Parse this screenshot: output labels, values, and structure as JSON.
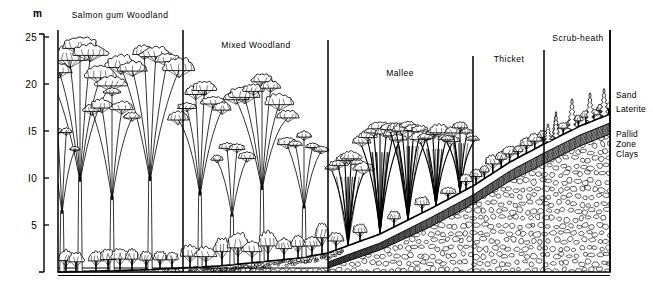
{
  "figure": {
    "axis_unit_label": "m",
    "y_ticks": [
      "25",
      "20",
      "I5",
      "I0",
      "5"
    ],
    "y_tick_values": [
      25,
      20,
      15,
      10,
      5
    ]
  },
  "vegetation_zones": [
    {
      "name": "Salmon gum Woodland",
      "label_x": 120,
      "label_y": 18
    },
    {
      "name": "Mixed Woodland",
      "label_x": 256,
      "label_y": 48
    },
    {
      "name": "Mallee",
      "label_x": 400,
      "label_y": 76
    },
    {
      "name": "Thicket",
      "label_x": 509,
      "label_y": 62
    },
    {
      "name": "Scrub-heath",
      "label_x": 578,
      "label_y": 41
    }
  ],
  "soil_horizons": [
    {
      "name": "Sand",
      "label_x": 616,
      "label_y": 98
    },
    {
      "name": "Laterite",
      "label_x": 616,
      "label_y": 112
    },
    {
      "name": "Pallid",
      "label_x": 616,
      "label_y": 137
    },
    {
      "name": "Zone",
      "label_x": 616,
      "label_y": 147
    },
    {
      "name": "Clays",
      "label_x": 616,
      "label_y": 157
    }
  ],
  "colors": {
    "ink": "#000000",
    "paper": "#ffffff",
    "stipple": "#111111"
  },
  "chart_data": {
    "type": "line",
    "title": "",
    "ylabel": "m",
    "ylim": [
      0,
      25
    ],
    "grid": false,
    "legend": "none",
    "xlabel": "",
    "categories": [
      "Salmon gum Woodland",
      "Mixed Woodland",
      "Mallee",
      "Thicket",
      "Scrub-heath"
    ],
    "series": [
      {
        "name": "Ground surface (m)",
        "x": [
          0,
          1,
          2,
          3,
          4,
          5,
          6,
          7,
          8,
          9,
          10
        ],
        "values": [
          0.2,
          0.4,
          0.8,
          1.6,
          3.0,
          5.2,
          8.0,
          11.0,
          14.0,
          16.4,
          18.2
        ]
      },
      {
        "name": "Laterite top (m)",
        "x": [
          4,
          5,
          6,
          7,
          8,
          9,
          10
        ],
        "values": [
          2.4,
          4.6,
          7.3,
          10.2,
          13.1,
          15.5,
          17.3
        ]
      },
      {
        "name": "Pallid zone top (m)",
        "x": [
          4,
          5,
          6,
          7,
          8,
          9,
          10
        ],
        "values": [
          1.8,
          3.9,
          6.4,
          9.1,
          11.8,
          14.0,
          15.6
        ]
      },
      {
        "name": "Canopy height (m)",
        "x": [
          0,
          1,
          2,
          3,
          4,
          5,
          6,
          7,
          8,
          9,
          10
        ],
        "values": [
          24.0,
          23.5,
          20.0,
          18.5,
          16.5,
          15.0,
          15.5,
          19.0,
          20.0,
          22.5,
          22.0
        ]
      }
    ]
  },
  "geometry": {
    "plot_left": 58,
    "plot_right": 610,
    "baseline_y": 272,
    "top_y": 8,
    "dividers_x": [
      183,
      328,
      473,
      544
    ],
    "axis_x": 44,
    "frame_top_y": 30,
    "ground": [
      [
        58,
        272
      ],
      [
        140,
        270
      ],
      [
        220,
        266
      ],
      [
        300,
        258
      ],
      [
        328,
        253
      ],
      [
        380,
        234
      ],
      [
        430,
        209
      ],
      [
        473,
        186
      ],
      [
        510,
        162
      ],
      [
        544,
        144
      ],
      [
        580,
        126
      ],
      [
        610,
        114
      ]
    ],
    "laterite_top": [
      [
        328,
        262
      ],
      [
        380,
        243
      ],
      [
        430,
        218
      ],
      [
        473,
        195
      ],
      [
        510,
        171
      ],
      [
        544,
        153
      ],
      [
        580,
        135
      ],
      [
        610,
        123
      ]
    ],
    "pallid_top": [
      [
        328,
        268
      ],
      [
        380,
        250
      ],
      [
        430,
        227
      ],
      [
        473,
        204
      ],
      [
        510,
        181
      ],
      [
        544,
        164
      ],
      [
        580,
        146
      ],
      [
        610,
        134
      ]
    ]
  }
}
